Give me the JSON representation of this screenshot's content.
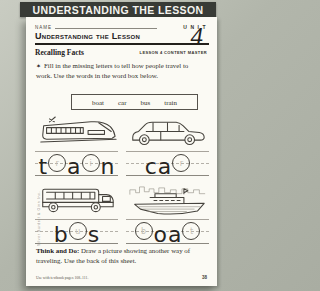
{
  "banner": {
    "title": "UNDERSTANDING THE LESSON"
  },
  "header": {
    "name_label": "NAME",
    "unit_label": "UNIT",
    "unit_number": "4",
    "title": "Understanding the Lesson",
    "section": "Recalling Facts",
    "master_label": "LESSON 4 CONTENT MASTER"
  },
  "instruction": {
    "bullet": "✶",
    "text": "Fill in the missing letters to tell how people travel to work. Use the words in the word box below."
  },
  "word_box": {
    "words": [
      "boat",
      "car",
      "bus",
      "train"
    ]
  },
  "exercises": [
    {
      "vehicle": "train",
      "slots": [
        {
          "type": "letter",
          "char": "t"
        },
        {
          "type": "circle",
          "hint": "r"
        },
        {
          "type": "letter",
          "char": "a"
        },
        {
          "type": "circle",
          "hint": "i"
        },
        {
          "type": "letter",
          "char": "n"
        }
      ]
    },
    {
      "vehicle": "car",
      "slots": [
        {
          "type": "letter",
          "char": "c"
        },
        {
          "type": "letter",
          "char": "a"
        },
        {
          "type": "circle",
          "hint": "r"
        }
      ]
    },
    {
      "vehicle": "bus",
      "slots": [
        {
          "type": "letter",
          "char": "b"
        },
        {
          "type": "circle",
          "hint": "u"
        },
        {
          "type": "letter",
          "char": "s"
        }
      ]
    },
    {
      "vehicle": "boat",
      "slots": [
        {
          "type": "circle",
          "hint": "b"
        },
        {
          "type": "letter",
          "char": "o"
        },
        {
          "type": "letter",
          "char": "a"
        },
        {
          "type": "circle",
          "hint": "t"
        }
      ]
    }
  ],
  "think_and_do": {
    "label": "Think and Do:",
    "text": "Draw a picture showing another way of traveling. Use the back of this sheet."
  },
  "footer": {
    "note": "Use with textbook pages 108–111.",
    "page_number": "38"
  },
  "copyright": "© Silver Burdett & Ginn Inc."
}
